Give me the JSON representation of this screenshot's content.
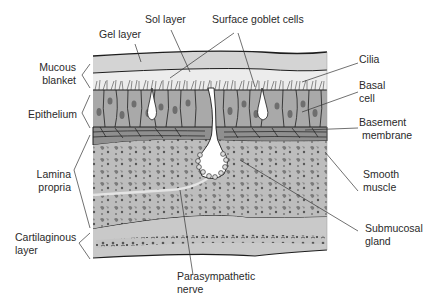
{
  "figure": {
    "colors": {
      "gel": "#d4d4d4",
      "sol": "#e9e9e9",
      "epithelium": "#a9a9a9",
      "nucleus": "#6e6e6e",
      "goblet": "#ffffff",
      "submucosa": "#b9b9b9",
      "cartilage": "#c6c6c6",
      "ink": "#1e1e1e"
    }
  },
  "labels": {
    "gel_layer": "Gel layer",
    "sol_layer": "Sol layer",
    "surface_goblet_cells": "Surface goblet cells",
    "mucous_blanket_1": "Mucous",
    "mucous_blanket_2": "blanket",
    "epithelium": "Epithelium",
    "lamina_propria_1": "Lamina",
    "lamina_propria_2": "propria",
    "cartilaginous_layer_1": "Cartilaginous",
    "cartilaginous_layer_2": "layer",
    "cilia": "Cilia",
    "basal_cell_1": "Basal",
    "basal_cell_2": "cell",
    "basement_membrane_1": "Basement",
    "basement_membrane_2": "membrane",
    "smooth_muscle_1": "Smooth",
    "smooth_muscle_2": "muscle",
    "submucosal_gland_1": "Submucosal",
    "submucosal_gland_2": "gland",
    "parasympathetic_nerve_1": "Parasympathetic",
    "parasympathetic_nerve_2": "nerve"
  }
}
